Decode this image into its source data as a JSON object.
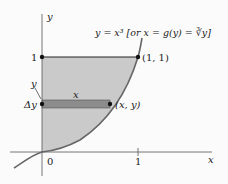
{
  "figure": {
    "axes": {
      "x_label": "x",
      "y_label": "y",
      "origin_label": "0",
      "x_tick": "1",
      "y_tick": "1"
    },
    "curve_label": "y = x³ [or x = g(y) = ∛y]",
    "point_top": "(1, 1)",
    "point_strip": "(x, y)",
    "strip_width_label": "x",
    "strip_y_label": "y",
    "strip_dy_label": "Δy",
    "colors": {
      "region": "#c9c9c9",
      "strip": "#8a8a8a",
      "curve": "#666666",
      "axis": "#444444",
      "line": "#222222"
    }
  }
}
